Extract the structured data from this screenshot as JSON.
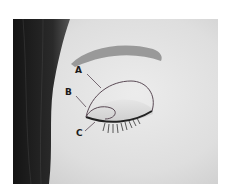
{
  "figure": {
    "labels": [
      {
        "id": "A",
        "text": "A",
        "region": "upper lid crease area"
      },
      {
        "id": "B",
        "text": "B",
        "region": "inner lid corner"
      },
      {
        "id": "C",
        "text": "C",
        "region": "lower lash line inner corner"
      }
    ],
    "colors": {
      "outline": "#5a4a55",
      "label": "#1a1a1a",
      "hair": "#1c1c1c",
      "skin": "#dcdcdc"
    }
  }
}
